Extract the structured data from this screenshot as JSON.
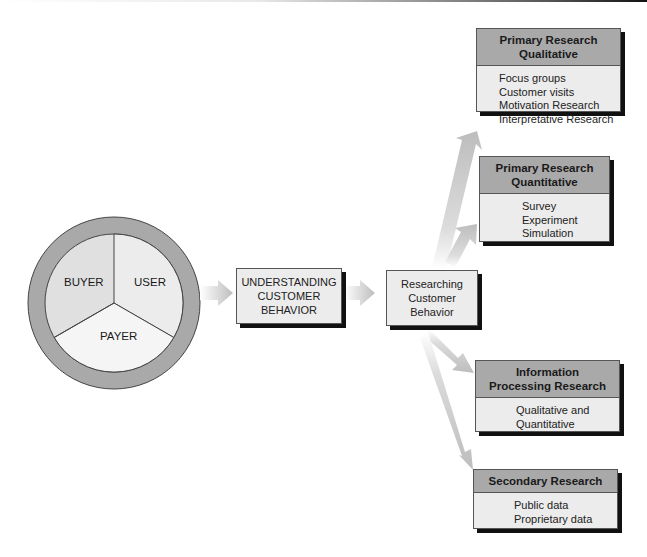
{
  "diagram": {
    "circle": {
      "segments": [
        {
          "label": "BUYER"
        },
        {
          "label": "USER"
        },
        {
          "label": "PAYER"
        }
      ],
      "ring_color": "#a9a9a9",
      "segment_colors": [
        "#e0e0e0",
        "#ececec",
        "#f4f4f4"
      ]
    },
    "flow": {
      "understanding": [
        "UNDERSTANDING",
        "CUSTOMER",
        "BEHAVIOR"
      ],
      "researching": [
        "Researching",
        "Customer",
        "Behavior"
      ]
    },
    "research_boxes": [
      {
        "title": [
          "Primary Research",
          "Qualitative"
        ],
        "items": [
          "Focus groups",
          "Customer visits",
          "Motivation Research",
          "Interpretative Research"
        ]
      },
      {
        "title": [
          "Primary Research",
          "Quantitative"
        ],
        "items": [
          "Survey",
          "Experiment",
          "Simulation"
        ]
      },
      {
        "title": [
          "Information",
          "Processing Research"
        ],
        "items": [
          "Qualitative and",
          "Quantitative"
        ]
      },
      {
        "title": [
          "Secondary Research"
        ],
        "items": [
          "Public data",
          "Proprietary data"
        ]
      }
    ],
    "colors": {
      "header_fill": "#a9a9a9",
      "body_fill": "#ececec",
      "shadow": "#111111",
      "arrow": "#c8c8c8"
    }
  }
}
